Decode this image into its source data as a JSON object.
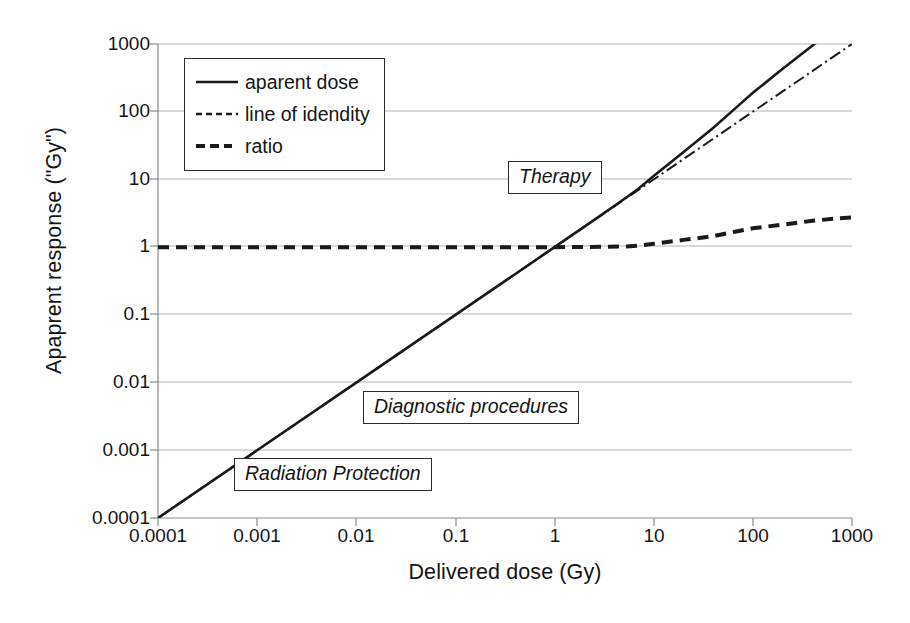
{
  "chart_data": {
    "type": "line",
    "title": "",
    "xlabel": "Delivered dose (Gy)",
    "ylabel": "Apaprent response (\"Gy\")",
    "xscale": "log",
    "yscale": "log",
    "xlim": [
      0.0001,
      1000
    ],
    "ylim": [
      0.0001,
      1000
    ],
    "xticks": [
      "0.0001",
      "0.001",
      "0.01",
      "0.1",
      "1",
      "10",
      "100",
      "1000"
    ],
    "xtick_values": [
      0.0001,
      0.001,
      0.01,
      0.1,
      1,
      10,
      100,
      1000
    ],
    "yticks": [
      "0.0001",
      "0.001",
      "0.01",
      "0.1",
      "1",
      "10",
      "100",
      "1000"
    ],
    "ytick_values": [
      0.0001,
      0.001,
      0.01,
      0.1,
      1,
      10,
      100,
      1000
    ],
    "grid": "horizontal-major",
    "legend_position": "top-left-inside",
    "series": [
      {
        "name": "aparent dose",
        "style": "solid",
        "color": "#1a1a1a",
        "x": [
          0.0001,
          0.001,
          0.01,
          0.1,
          1,
          3,
          5,
          7,
          10,
          20,
          40,
          70,
          100,
          200,
          400,
          700,
          1000
        ],
        "y": [
          0.0001,
          0.001,
          0.01,
          0.1,
          1,
          3.02,
          5.1,
          7.3,
          11.2,
          25.5,
          58,
          120,
          190,
          430,
          950,
          1800,
          2750
        ]
      },
      {
        "name": "line of idendity",
        "style": "dashdot",
        "color": "#1a1a1a",
        "x": [
          0.0001,
          1000
        ],
        "y": [
          0.0001,
          1000
        ]
      },
      {
        "name": "ratio",
        "style": "dashed-bold",
        "color": "#1a1a1a",
        "x": [
          0.0001,
          0.001,
          0.01,
          0.1,
          1,
          3,
          5,
          7,
          10,
          20,
          40,
          70,
          100,
          200,
          400,
          700,
          1000
        ],
        "y": [
          1.0,
          1.0,
          1.0,
          1.0,
          1.0,
          1.01,
          1.02,
          1.05,
          1.12,
          1.28,
          1.45,
          1.72,
          1.9,
          2.15,
          2.45,
          2.65,
          2.75
        ]
      }
    ],
    "annotations": [
      {
        "text": "Therapy",
        "x": 18,
        "y": 16,
        "style": "boxed-italic"
      },
      {
        "text": "Diagnostic procedures",
        "x": 0.06,
        "y": 0.007,
        "style": "boxed-italic"
      },
      {
        "text": "Radiation Protection",
        "x": 0.004,
        "y": 0.0007,
        "style": "boxed-italic"
      }
    ]
  },
  "legend": {
    "items": [
      {
        "label": "aparent dose",
        "swatch": "solid-line-swatch"
      },
      {
        "label": "line of idendity",
        "swatch": "dashed-line-swatch"
      },
      {
        "label": "ratio",
        "swatch": "bold-dashed-line-swatch"
      }
    ]
  },
  "axes": {
    "x_title": "Delivered dose (Gy)",
    "y_title": "Apaprent response (\"Gy\")",
    "x_labels": [
      "0.0001",
      "0.001",
      "0.01",
      "0.1",
      "1",
      "10",
      "100",
      "1000"
    ],
    "y_labels": [
      "1000",
      "100",
      "10",
      "1",
      "0.1",
      "0.01",
      "0.001",
      "0.0001"
    ]
  },
  "annotations": {
    "therapy": "Therapy",
    "diagnostic": "Diagnostic procedures",
    "radiation_protection": "Radiation Protection"
  },
  "colors": {
    "line": "#1a1a1a",
    "grid": "#b4b4b4",
    "axis": "#8c8c8c",
    "background": "#ffffff"
  }
}
